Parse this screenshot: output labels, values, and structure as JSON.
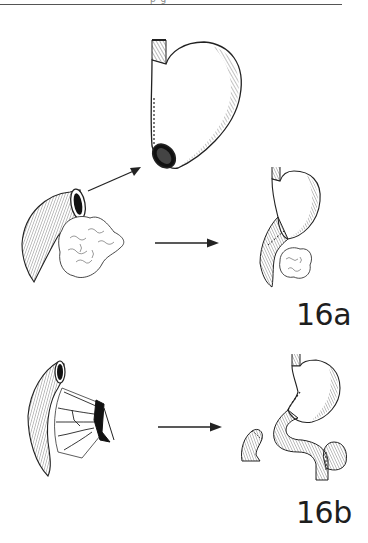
{
  "page": {
    "header_fragment": "p  g",
    "background": "#ffffff",
    "ink_color": "#1e1e1e"
  },
  "figures": {
    "fig_16a": {
      "label": "16a",
      "panels": [
        {
          "name": "duodenum-pancreas-specimen",
          "description": "Curved duodenal loop with open lumen and attached pancreatic head tissue"
        },
        {
          "name": "stomach-resected",
          "description": "Stomach with sutured lesser curvature and open distal end"
        },
        {
          "name": "stomach-duodenum-pancreas-result",
          "description": "Stomach continuous with duodenal C-loop and pancreatic head"
        }
      ],
      "arrows": [
        {
          "name": "diagonal-arrow",
          "from": [
            88,
            191
          ],
          "to": [
            140,
            167
          ]
        },
        {
          "name": "horizontal-arrow-a",
          "from": [
            155,
            243
          ],
          "to": [
            217,
            243
          ]
        }
      ]
    },
    "fig_16b": {
      "label": "16b",
      "panels": [
        {
          "name": "jejunal-loop-mesentery",
          "description": "Jejunal loop with mesenteric vessels fanning to cut edge"
        },
        {
          "name": "jejunal-stump",
          "description": "Small separated bowel stump"
        },
        {
          "name": "stomach-jejunum-reconstruction",
          "description": "Stomach anastomosed to S-shaped jejunal limb with side loop"
        }
      ],
      "arrows": [
        {
          "name": "horizontal-arrow-b",
          "from": [
            158,
            427
          ],
          "to": [
            220,
            427
          ]
        }
      ]
    }
  }
}
